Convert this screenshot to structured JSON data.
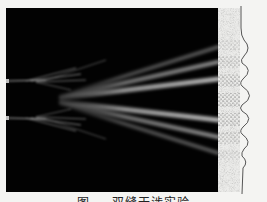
{
  "figure": {
    "caption": "图 …  双缝干涉实验",
    "caption_visibility": "clipped at bottom edge, partially legible",
    "colors": {
      "background": "#f4f4f2",
      "panel": "#020202",
      "beam": "#e6e6e6",
      "detector_dots": "#333333",
      "curve": "#555555"
    },
    "slits": [
      {
        "name": "upper-slit",
        "y": 81
      },
      {
        "name": "lower-slit",
        "y": 118
      }
    ],
    "fringes_at_screen_y": [
      47,
      62,
      79,
      100,
      120,
      137,
      153
    ],
    "central_fringe_y": 100
  }
}
